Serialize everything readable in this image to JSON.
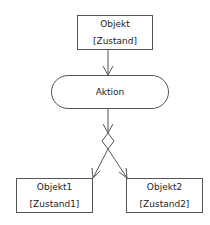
{
  "diagram": {
    "type": "UML activity diagram (object flow with decision)",
    "nodes": {
      "top_object": {
        "name": "Objekt",
        "state": "[Zustand]"
      },
      "action": {
        "label": "Aktion"
      },
      "decision": {
        "shape": "diamond"
      },
      "left_object": {
        "name": "Objekt1",
        "state": "[Zustand1]"
      },
      "right_object": {
        "name": "Objekt2",
        "state": "[Zustand2]"
      }
    },
    "edges": [
      {
        "from": "top_object",
        "to": "action"
      },
      {
        "from": "action",
        "to": "decision"
      },
      {
        "from": "decision",
        "to": "left_object"
      },
      {
        "from": "decision",
        "to": "right_object"
      }
    ],
    "colors": {
      "stroke": "#555555",
      "text": "#222222",
      "background": "#ffffff"
    }
  }
}
